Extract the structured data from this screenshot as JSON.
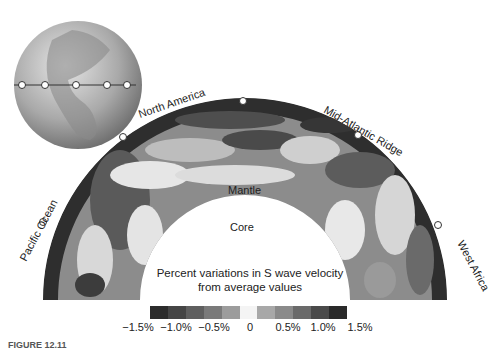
{
  "figure": {
    "labels": {
      "pacific_ocean": "Pacific Ocean",
      "north_america": "North America",
      "mid_atlantic_ridge": "Mid-Atlantic Ridge",
      "west_africa": "West Africa",
      "mantle": "Mantle",
      "core": "Core"
    },
    "legend": {
      "title_line1": "Percent variations in S wave velocity",
      "title_line2": "from average values",
      "colors": [
        "#2c2c2c",
        "#454545",
        "#5f5f5f",
        "#7a7a7a",
        "#9c9c9c",
        "#f4f4f4",
        "#a8a8a8",
        "#8a8a8a",
        "#6a6a6a",
        "#4a4a4a",
        "#2a2a2a"
      ],
      "ticks": [
        "−1.5%",
        "−1.0%",
        "−0.5%",
        "0",
        "0.5%",
        "1.0%",
        "1.5%"
      ]
    },
    "caption": "FIGURE 12.11"
  }
}
